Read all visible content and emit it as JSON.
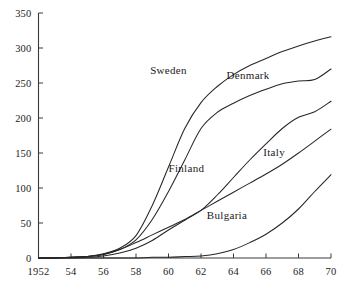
{
  "chart_data": {
    "type": "line",
    "title": "",
    "subtitle": "",
    "xlabel": "",
    "ylabel": "",
    "xlim": [
      1952,
      1970
    ],
    "ylim": [
      0,
      350
    ],
    "grid": false,
    "legend_position": "inline-labels",
    "x_tick_labels": [
      "1952",
      "54",
      "56",
      "58",
      "60",
      "62",
      "64",
      "66",
      "68",
      "70"
    ],
    "x_ticks": [
      1952,
      1954,
      1956,
      1958,
      1960,
      1962,
      1964,
      1966,
      1968,
      1970
    ],
    "y_tick_labels": [
      "0",
      "50",
      "100",
      "150",
      "200",
      "250",
      "300",
      "350"
    ],
    "y_ticks": [
      0,
      50,
      100,
      150,
      200,
      250,
      300,
      350
    ],
    "x": [
      1952,
      1953,
      1954,
      1955,
      1956,
      1957,
      1958,
      1959,
      1960,
      1961,
      1962,
      1963,
      1964,
      1965,
      1966,
      1967,
      1968,
      1969,
      1970
    ],
    "series": [
      {
        "name": "Sweden",
        "label": "Sweden",
        "color": "#262626",
        "label_x": 1960.0,
        "label_y": 268,
        "values": [
          0,
          0,
          1,
          2,
          6,
          14,
          32,
          75,
          130,
          185,
          222,
          245,
          262,
          275,
          285,
          295,
          303,
          310,
          316
        ]
      },
      {
        "name": "Denmark",
        "label": "Denmark",
        "color": "#262626",
        "label_x": 1964.9,
        "label_y": 262,
        "values": [
          0,
          0,
          1,
          2,
          5,
          12,
          26,
          55,
          95,
          140,
          185,
          208,
          221,
          232,
          241,
          249,
          253,
          255,
          270
        ]
      },
      {
        "name": "Finland",
        "label": "Finland",
        "color": "#262626",
        "label_x": 1961.1,
        "label_y": 128,
        "values": [
          0,
          0,
          0,
          1,
          3,
          7,
          14,
          25,
          40,
          54,
          68,
          90,
          115,
          140,
          163,
          185,
          201,
          209,
          224
        ]
      },
      {
        "name": "Italy",
        "label": "Italy",
        "color": "#262626",
        "label_x": 1966.5,
        "label_y": 152,
        "values": [
          0,
          0,
          1,
          2,
          5,
          12,
          22,
          33,
          44,
          55,
          68,
          81,
          94,
          107,
          120,
          134,
          150,
          167,
          184
        ]
      },
      {
        "name": "Bulgaria",
        "label": "Bulgaria",
        "color": "#262626",
        "label_x": 1963.6,
        "label_y": 62,
        "values": [
          0,
          0,
          0,
          0,
          0,
          0,
          0,
          1,
          1,
          2,
          3,
          6,
          12,
          22,
          34,
          50,
          70,
          95,
          119
        ]
      }
    ],
    "axis_color": "#3a3a3a",
    "line_color": "#262626",
    "background": "#ffffff"
  }
}
